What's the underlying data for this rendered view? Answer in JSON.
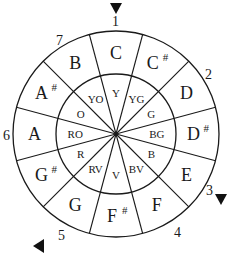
{
  "diagram": {
    "center": [
      116,
      134
    ],
    "outer_radius": 103,
    "inner_radius": 60,
    "start_angle_deg": -105,
    "sector_count": 12,
    "stroke_color": "#1a1a1a",
    "background": "#ffffff",
    "sectors": [
      {
        "note": "C",
        "sharp": false,
        "color": "Y"
      },
      {
        "note": "C",
        "sharp": true,
        "color": "YG"
      },
      {
        "note": "D",
        "sharp": false,
        "color": "G"
      },
      {
        "note": "D",
        "sharp": true,
        "color": "BG"
      },
      {
        "note": "E",
        "sharp": false,
        "color": "B"
      },
      {
        "note": "F",
        "sharp": false,
        "color": "BV"
      },
      {
        "note": "F",
        "sharp": true,
        "color": "V"
      },
      {
        "note": "G",
        "sharp": false,
        "color": "RV"
      },
      {
        "note": "G",
        "sharp": true,
        "color": "R"
      },
      {
        "note": "A",
        "sharp": false,
        "color": "RO"
      },
      {
        "note": "A",
        "sharp": true,
        "color": "O"
      },
      {
        "note": "B",
        "sharp": false,
        "color": "YO"
      }
    ],
    "sharp_symbol": "#",
    "numbers": [
      {
        "label": "1",
        "x": 112,
        "y": 26
      },
      {
        "label": "2",
        "x": 205,
        "y": 79
      },
      {
        "label": "3",
        "x": 206,
        "y": 195
      },
      {
        "label": "4",
        "x": 174,
        "y": 237
      },
      {
        "label": "5",
        "x": 58,
        "y": 240
      },
      {
        "label": "6",
        "x": 3,
        "y": 140
      },
      {
        "label": "7",
        "x": 56,
        "y": 45
      }
    ],
    "markers": [
      {
        "name": "marker-1",
        "direction": "down",
        "x": 116,
        "y": 9
      },
      {
        "name": "marker-3",
        "direction": "down",
        "x": 221,
        "y": 200
      },
      {
        "name": "marker-5",
        "direction": "left",
        "x": 39,
        "y": 246
      }
    ]
  }
}
